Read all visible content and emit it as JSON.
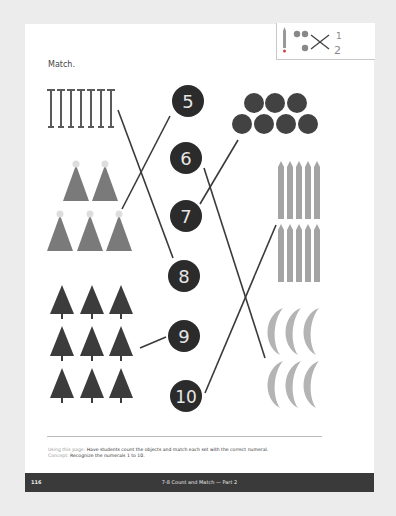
{
  "header": {
    "instruction": "Match.",
    "corner_icon": "pencil-counters-match-icon",
    "corner_fraction": {
      "numerator": "1",
      "denominator": "2"
    }
  },
  "numerals": [
    "5",
    "6",
    "7",
    "8",
    "9",
    "10"
  ],
  "sets": [
    {
      "object": "nails",
      "icon": "nail-icon",
      "count": 7,
      "side": "left",
      "matched_to": "8"
    },
    {
      "object": "party hats",
      "icon": "party-hat-icon",
      "count": 5,
      "side": "left",
      "matched_to": "5"
    },
    {
      "object": "trees",
      "icon": "tree-icon",
      "count": 9,
      "side": "left",
      "matched_to": "9"
    },
    {
      "object": "pomegranates",
      "icon": "pomegranate-icon",
      "count": 7,
      "side": "right",
      "matched_to": "7"
    },
    {
      "object": "pencils",
      "icon": "pencil-icon",
      "count": 10,
      "side": "right",
      "matched_to": "10"
    },
    {
      "object": "bananas",
      "icon": "banana-icon",
      "count": 6,
      "side": "right",
      "matched_to": "6"
    }
  ],
  "footer": {
    "using_label": "Using this page:",
    "using_text": " Have students count the objects and match each set with the correct numeral.",
    "concept_label": "Concept:",
    "concept_text": " Recognize the numerals 1 to 10.",
    "page_number": "116",
    "lesson_title": "7-8  Count and Match — Part 2"
  },
  "colors": {
    "circle": "#2b2b2b",
    "numeral": "#e6e6e6",
    "object_dark": "#4a4a4a",
    "object_light": "#9a9a9a",
    "line": "#3a3a3a",
    "footer_bar": "#3a3a3a"
  }
}
